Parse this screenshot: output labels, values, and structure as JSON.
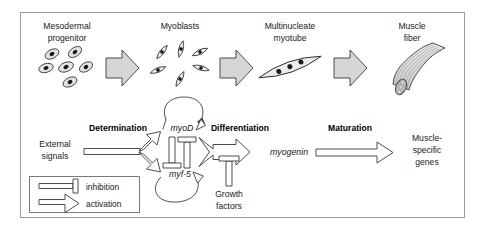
{
  "figure": {
    "border_color": "#9a9a9a",
    "background": "#ffffff",
    "arrow_fill": "#d6d6d6",
    "arrow_stroke": "#3a3a3a",
    "cell_fill": "#e2e2e2",
    "nucleus_fill": "#1a1a1a",
    "fiber_fill": "#dcdcdc"
  },
  "stages": [
    {
      "id": "mesodermal-progenitor",
      "label_line1": "Mesodermal",
      "label_line2": "progenitor",
      "icon": "progenitor-cells-icon",
      "cell_count": 6
    },
    {
      "id": "myoblasts",
      "label_line1": "Myoblasts",
      "label_line2": "",
      "icon": "myoblast-cells-icon",
      "cell_count": 6
    },
    {
      "id": "multinucleate-myotube",
      "label_line1": "Multinucleate",
      "label_line2": "myotube",
      "icon": "myotube-icon",
      "cell_count": 3
    },
    {
      "id": "muscle-fiber",
      "label_line1": "Muscle",
      "label_line2": "fiber",
      "icon": "muscle-fiber-icon",
      "cell_count": 0
    }
  ],
  "stage_arrows": [
    {
      "id": "arrow-progenitor-to-myoblasts",
      "kind": "activation-block-arrow"
    },
    {
      "id": "arrow-myoblasts-to-myotube",
      "kind": "activation-block-arrow"
    },
    {
      "id": "arrow-myotube-to-fiber",
      "kind": "activation-block-arrow"
    }
  ],
  "network": {
    "input": {
      "label_line1": "External",
      "label_line2": "signals"
    },
    "steps": [
      {
        "id": "determination",
        "label": "Determination"
      },
      {
        "id": "differentiation",
        "label": "Differentiation"
      },
      {
        "id": "maturation",
        "label": "Maturation"
      }
    ],
    "genes": [
      {
        "id": "myod",
        "label": "myoD",
        "autoregulation": "positive-feedback-loop"
      },
      {
        "id": "myf5",
        "label": "myf-5",
        "autoregulation": "positive-feedback-loop"
      },
      {
        "id": "myogenin",
        "label": "myogenin",
        "autoregulation": "none"
      }
    ],
    "modulator": {
      "id": "growth-factors",
      "label_line1": "Growth",
      "label_line2": "factors",
      "effect": "inhibition"
    },
    "output": {
      "id": "muscle-specific-genes",
      "label_line1": "Muscle-",
      "label_line2": "specific",
      "label_line3": "genes"
    },
    "interactions": [
      {
        "from": "external-signals",
        "to": "myod",
        "type": "activation"
      },
      {
        "from": "external-signals",
        "to": "myf5",
        "type": "activation"
      },
      {
        "from": "myod",
        "to": "myf5",
        "type": "inhibition"
      },
      {
        "from": "myf5",
        "to": "myod",
        "type": "inhibition"
      },
      {
        "from": "myod",
        "to": "myogenin",
        "type": "activation"
      },
      {
        "from": "myf5",
        "to": "myogenin",
        "type": "activation"
      },
      {
        "from": "growth-factors",
        "to": "differentiation",
        "type": "inhibition"
      },
      {
        "from": "myogenin",
        "to": "muscle-specific-genes",
        "type": "activation"
      }
    ]
  },
  "legend": {
    "items": [
      {
        "id": "legend-inhibition",
        "symbol": "inhibition-bar-icon",
        "label": "inhibition"
      },
      {
        "id": "legend-activation",
        "symbol": "activation-arrow-icon",
        "label": "activation"
      }
    ]
  }
}
